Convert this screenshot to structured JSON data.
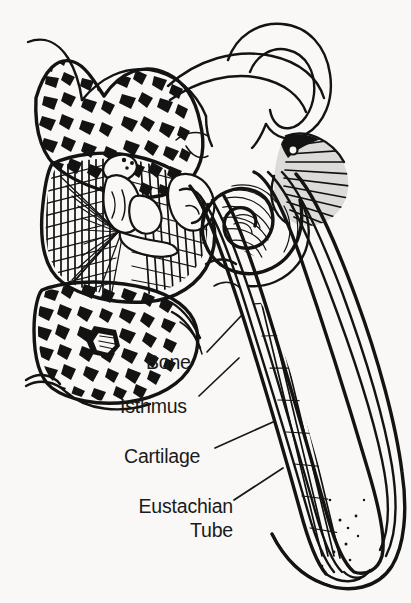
{
  "figure": {
    "kind": "anatomical-line-drawing",
    "background_color": "#f9f8f6",
    "ink_color": "#131313",
    "label_color": "#1a1a1a",
    "width": 411,
    "height": 603
  },
  "labels": {
    "bone": "Bone",
    "isthmus": "Isthmus",
    "cartilage": "Cartilage",
    "eustachian_line1": "Eustachian",
    "eustachian_line2": "Tube"
  },
  "structures": [
    {
      "name": "mastoid-air-cells-upper",
      "描述": "stippled cancellous bone, upper left"
    },
    {
      "name": "mastoid-air-cells-lower",
      "描述": "stippled cancellous bone, lower left"
    },
    {
      "name": "middle-ear-hatching",
      "描述": "dense cross-hatched middle ear cavity"
    },
    {
      "name": "ossicles",
      "描述": "white outlined malleus and incus"
    },
    {
      "name": "semicircular-canals",
      "描述": "thin looped canals, upper right"
    },
    {
      "name": "cochlea",
      "描述": "spiral with radial hatching, right"
    },
    {
      "name": "eustachian-tube-channel",
      "描述": "tapered tube with parallel walls and vertical hatching"
    }
  ]
}
